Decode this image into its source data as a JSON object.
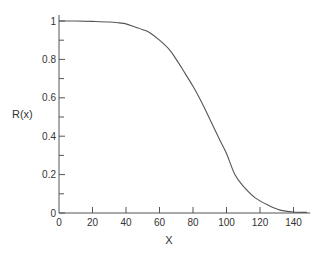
{
  "chart_data": {
    "type": "line",
    "title": "",
    "xlabel": "X",
    "ylabel": "R(x)",
    "xlim": [
      0,
      150
    ],
    "ylim": [
      0,
      1
    ],
    "grid": false,
    "legend": null,
    "x_ticks": [
      0,
      20,
      40,
      60,
      80,
      100,
      120,
      140
    ],
    "x_tick_labels": [
      "0",
      "20",
      "40",
      "60",
      "80",
      "100",
      "120",
      "140"
    ],
    "y_ticks": [
      0,
      0.2,
      0.4,
      0.6,
      0.8,
      1
    ],
    "y_tick_labels": [
      "0",
      "0.2",
      "0.4",
      "0.6",
      "0.8",
      "1"
    ],
    "y_minor_ticks": [
      0.1,
      0.3,
      0.5,
      0.7,
      0.9
    ],
    "series": [
      {
        "name": "R(x)",
        "color": "#555555",
        "x": [
          0,
          10,
          20,
          30,
          36,
          40,
          45,
          50,
          54,
          60,
          66,
          70,
          74,
          80,
          85,
          90,
          96,
          100,
          105,
          110,
          117,
          125,
          132,
          140,
          148
        ],
        "y": [
          1.0,
          1.0,
          0.998,
          0.995,
          0.99,
          0.985,
          0.97,
          0.955,
          0.94,
          0.9,
          0.85,
          0.8,
          0.745,
          0.66,
          0.58,
          0.49,
          0.38,
          0.31,
          0.2,
          0.14,
          0.08,
          0.04,
          0.015,
          0.005,
          0.003
        ]
      }
    ]
  }
}
